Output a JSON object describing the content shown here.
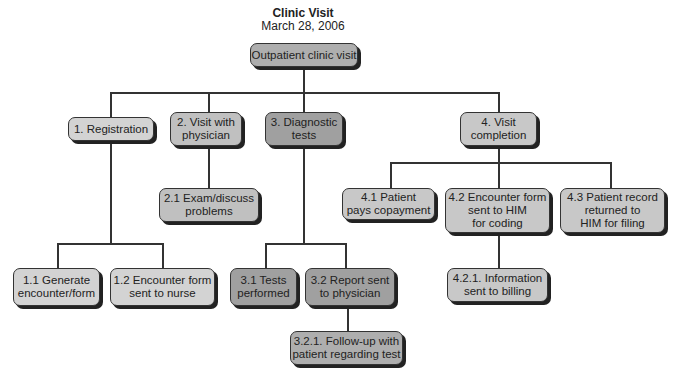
{
  "title": "Clinic Visit",
  "subtitle": "March 28, 2006",
  "colors": {
    "root": "#aeaeae",
    "light": "#d3d3d3",
    "medium": "#c0c0c0",
    "dark": "#a0a0a0",
    "line": "#333333"
  },
  "nodes": {
    "root": "Outpatient clinic visit",
    "n1": "1. Registration",
    "n2": "2. Visit with\nphysician",
    "n3": "3. Diagnostic\ntests",
    "n4": "4. Visit\ncompletion",
    "n1_1": "1.1 Generate\nencounter/form",
    "n1_2": "1.2 Encounter form\nsent to nurse",
    "n2_1": "2.1 Exam/discuss\nproblems",
    "n3_1": "3.1 Tests\nperformed",
    "n3_2": "3.2 Report sent\nto physician",
    "n3_2_1": "3.2.1. Follow-up with\npatient regarding test",
    "n4_1": "4.1 Patient\npays copayment",
    "n4_2": "4.2 Encounter form\nsent to HIM\nfor coding",
    "n4_3": "4.3 Patient record\nreturned to\nHIM for filing",
    "n4_2_1": "4.2.1. Information\nsent to billing"
  }
}
